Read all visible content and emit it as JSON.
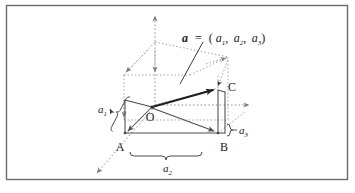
{
  "figure": {
    "kind": "3d-vector-decomposition-diagram",
    "frame": {
      "border_color": "#6b6b6b",
      "background": "#ffffff",
      "x": 6,
      "y": 5,
      "width": 342,
      "height": 175
    },
    "colors": {
      "stroke": "#4d4d4d",
      "vector_stroke": "#262626",
      "dashed_stroke": "#8c8c8c",
      "text": "#1a1a1a",
      "frame": "#6b6b6b"
    },
    "vector_label": {
      "name": "vector-equation",
      "vector": "a",
      "equals": "=",
      "open": "(",
      "comp1_base": "a",
      "comp1_sub": "1",
      "comma1": ",",
      "comp2_base": "a",
      "comp2_sub": "2",
      "comma2": ",",
      "comp3_base": "a",
      "comp3_sub": "3",
      "close": ")",
      "full_text": "a = (a1, a2, a3)"
    },
    "points": [
      {
        "name": "origin",
        "label": "O",
        "x": 152,
        "y": 107,
        "label_x": 150,
        "label_y": 120
      },
      {
        "name": "point-a",
        "label": "A",
        "x": 125,
        "y": 133,
        "label_x": 119,
        "label_y": 150
      },
      {
        "name": "point-b",
        "label": "B",
        "x": 218,
        "y": 133,
        "label_x": 221,
        "label_y": 150
      },
      {
        "name": "point-c",
        "label": "C",
        "x": 218,
        "y": 88,
        "label_x": 226,
        "label_y": 88
      },
      {
        "name": "vector-tip",
        "label": "",
        "x": 212,
        "y": 90,
        "label_x": 0,
        "label_y": 0
      }
    ],
    "component_labels": [
      {
        "name": "component-a1",
        "base": "a",
        "sub": "1",
        "x": 104,
        "y": 110
      },
      {
        "name": "component-a2",
        "base": "a",
        "sub": "2",
        "x": 167,
        "y": 170
      },
      {
        "name": "component-a3",
        "base": "a",
        "sub": "3",
        "x": 240,
        "y": 136
      }
    ],
    "axes": [
      {
        "name": "axis-vertical",
        "from": [
          155,
          105
        ],
        "to": [
          155,
          14
        ]
      },
      {
        "name": "axis-horizontal",
        "from": [
          155,
          105
        ],
        "to": [
          252,
          105
        ]
      },
      {
        "name": "axis-diagonal",
        "from": [
          155,
          105
        ],
        "to": [
          94,
          176
        ]
      }
    ],
    "caption": {
      "name": "figure-caption-partial",
      "text": ""
    }
  }
}
